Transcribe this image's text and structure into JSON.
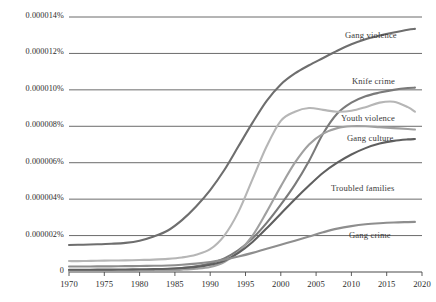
{
  "chart_data": {
    "type": "line",
    "title": "",
    "subtitle": "",
    "xlabel": "",
    "ylabel": "",
    "grid": true,
    "legend_position": "inline-right",
    "xlim": [
      1970,
      2020
    ],
    "ylim": [
      0,
      1.4e-05
    ],
    "x_ticks": [
      "1970",
      "1975",
      "1980",
      "1985",
      "1990",
      "1995",
      "2000",
      "2005",
      "2010",
      "2015",
      "2020"
    ],
    "y_ticks": [
      "0",
      "0.000002%",
      "0.000004%",
      "0.000006%",
      "0.000008%",
      "0.000010%",
      "0.000012%",
      "0.000014%"
    ],
    "y_tick_values": [
      0,
      2e-06,
      4e-06,
      6e-06,
      8e-06,
      1e-05,
      1.2e-05,
      1.4e-05
    ],
    "x": [
      1970,
      1972,
      1974,
      1976,
      1978,
      1980,
      1982,
      1984,
      1986,
      1988,
      1990,
      1992,
      1994,
      1996,
      1998,
      2000,
      2002,
      2004,
      2006,
      2008,
      2010,
      2012,
      2014,
      2016,
      2018,
      2019
    ],
    "series": [
      {
        "name": "Gang violence",
        "color": "#6e6e6e",
        "label_x": 345,
        "label_y": 30,
        "values": [
          1.48e-06,
          1.5e-06,
          1.52e-06,
          1.55e-06,
          1.6e-06,
          1.72e-06,
          1.95e-06,
          2.28e-06,
          2.85e-06,
          3.6e-06,
          4.5e-06,
          5.6e-06,
          6.9e-06,
          8.2e-06,
          9.4e-06,
          1.03e-05,
          1.09e-05,
          1.135e-05,
          1.175e-05,
          1.215e-05,
          1.25e-05,
          1.278e-05,
          1.298e-05,
          1.315e-05,
          1.33e-05,
          1.335e-05
        ]
      },
      {
        "name": "Knife crime",
        "color": "#7a7a7a",
        "label_x": 352,
        "label_y": 76,
        "values": [
          8e-08,
          8e-08,
          9e-08,
          9e-08,
          1e-07,
          1.1e-07,
          1.3e-07,
          1.6e-07,
          2.2e-07,
          3.2e-07,
          4.8e-07,
          7.5e-07,
          1.2e-06,
          1.85e-06,
          2.7e-06,
          3.7e-06,
          4.8e-06,
          6.1e-06,
          7.6e-06,
          8.7e-06,
          9.3e-06,
          9.65e-06,
          9.85e-06,
          1e-05,
          1.01e-05,
          1.012e-05
        ]
      },
      {
        "name": "Youth violence",
        "color": "#b6b6b6",
        "label_x": 341,
        "label_y": 113,
        "values": [
          6e-07,
          6e-07,
          6.2e-07,
          6.3e-07,
          6.4e-07,
          6.6e-07,
          6.8e-07,
          7.2e-07,
          8e-07,
          9.5e-07,
          1.25e-06,
          2e-06,
          3.3e-06,
          5.1e-06,
          6.9e-06,
          8.3e-06,
          8.8e-06,
          9e-06,
          8.9e-06,
          8.8e-06,
          8.85e-06,
          9.05e-06,
          9.3e-06,
          9.35e-06,
          9.05e-06,
          8.8e-06
        ]
      },
      {
        "name": "Gang culture",
        "color": "#a0a0a0",
        "label_x": 347,
        "label_y": 133,
        "values": [
          5e-08,
          5e-08,
          5e-08,
          6e-08,
          6e-08,
          7e-08,
          8e-08,
          1e-07,
          1.3e-07,
          1.8e-07,
          2.8e-07,
          5.5e-07,
          1.1e-06,
          2e-06,
          3.3e-06,
          4.7e-06,
          6e-06,
          7e-06,
          7.6e-06,
          7.9e-06,
          8e-06,
          8e-06,
          7.95e-06,
          7.9e-06,
          7.85e-06,
          7.82e-06
        ]
      },
      {
        "name": "Troubled families",
        "color": "#5f5f5f",
        "label_x": 331,
        "label_y": 183,
        "values": [
          1.2e-07,
          1.2e-07,
          1.3e-07,
          1.3e-07,
          1.4e-07,
          1.5e-07,
          1.6e-07,
          1.8e-07,
          2.2e-07,
          2.8e-07,
          4e-07,
          6.2e-07,
          1.05e-06,
          1.65e-06,
          2.4e-06,
          3.2e-06,
          4e-06,
          4.75e-06,
          5.45e-06,
          6e-06,
          6.45e-06,
          6.8e-06,
          7.05e-06,
          7.2e-06,
          7.28e-06,
          7.3e-06
        ]
      },
      {
        "name": "Gang crime",
        "color": "#8e8e8e",
        "label_x": 349,
        "label_y": 230,
        "values": [
          3e-07,
          3e-07,
          3.1e-07,
          3.1e-07,
          3.2e-07,
          3.3e-07,
          3.4e-07,
          3.6e-07,
          4e-07,
          4.6e-07,
          5.5e-07,
          6.8e-07,
          8.5e-07,
          1.05e-06,
          1.28e-06,
          1.5e-06,
          1.72e-06,
          1.95e-06,
          2.18e-06,
          2.38e-06,
          2.52e-06,
          2.62e-06,
          2.68e-06,
          2.72e-06,
          2.74e-06,
          2.75e-06
        ]
      }
    ]
  },
  "axis": {
    "grid_color": "#5a5a5a",
    "axis_color": "#4a4a4a",
    "background": "#ffffff"
  }
}
